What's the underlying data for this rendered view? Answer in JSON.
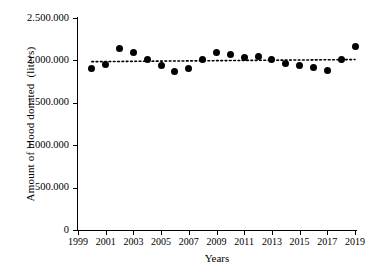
{
  "chart_data": {
    "type": "scatter",
    "title": "",
    "xlabel": "Years",
    "ylabel": "Amount of blood donated  (liters)",
    "xlim": [
      1999,
      2019
    ],
    "ylim": [
      0,
      2500000
    ],
    "grid": false,
    "legend": "none",
    "x_ticks": [
      "1999",
      "2001",
      "2003",
      "2005",
      "2007",
      "2009",
      "2011",
      "2013",
      "2015",
      "2017",
      "2019"
    ],
    "x_tick_values": [
      1999,
      2001,
      2003,
      2005,
      2007,
      2009,
      2011,
      2013,
      2015,
      2017,
      2019
    ],
    "y_ticks": [
      "0",
      "500.000",
      "1.000.000",
      "1.500.000",
      "2.000.000",
      "2.500.000"
    ],
    "y_tick_values": [
      0,
      500000,
      1000000,
      1500000,
      2000000,
      2500000
    ],
    "x": [
      2000,
      2001,
      2002,
      2003,
      2004,
      2005,
      2006,
      2007,
      2008,
      2009,
      2010,
      2011,
      2012,
      2013,
      2014,
      2015,
      2016,
      2017,
      2018,
      2019
    ],
    "values": [
      1900000,
      1950000,
      2140000,
      2090000,
      2005000,
      1935000,
      1870000,
      1905000,
      2005000,
      2090000,
      2070000,
      2030000,
      2050000,
      2005000,
      1960000,
      1940000,
      1915000,
      1880000,
      2005000,
      2160000
    ],
    "series": [
      {
        "name": "Amount of blood donated",
        "marker": "filled-circle",
        "color": "#000000",
        "values": [
          1900000,
          1950000,
          2140000,
          2090000,
          2005000,
          1935000,
          1870000,
          1905000,
          2005000,
          2090000,
          2070000,
          2030000,
          2050000,
          2005000,
          1960000,
          1940000,
          1915000,
          1880000,
          2005000,
          2160000
        ]
      },
      {
        "name": "trend-line",
        "type": "line",
        "style": "dotted",
        "color": "#000000",
        "x": [
          2000,
          2019
        ],
        "values": [
          1985000,
          2010000
        ]
      }
    ]
  },
  "axis": {
    "y_title": "Amount of blood donated  (liters)",
    "x_title": "Years"
  }
}
